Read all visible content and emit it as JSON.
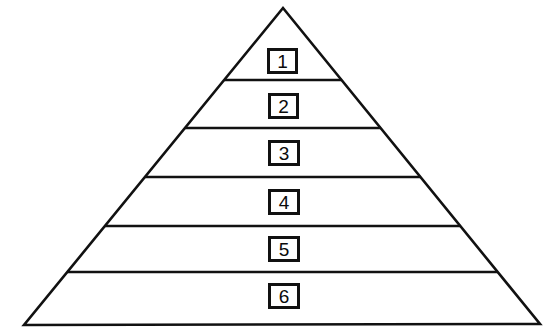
{
  "figure": {
    "type": "pyramid-diagram",
    "title": "",
    "background_color": "#ffffff",
    "stroke_color": "#111111",
    "fill_color": "#ffffff"
  },
  "pyramid": {
    "apex": {
      "x": 283,
      "y": 8
    },
    "base_left": {
      "x": 24,
      "y": 325
    },
    "base_right": {
      "x": 540,
      "y": 324
    },
    "outline_width": 2.6,
    "divider_width": 2.4,
    "divider_y": [
      80,
      128,
      177,
      226,
      272
    ],
    "levels": [
      {
        "label": "1",
        "order": 1,
        "band_top_y": 8,
        "band_bottom_y": 80,
        "box": {
          "x": 267,
          "y": 48,
          "w": 31,
          "h": 26
        }
      },
      {
        "label": "2",
        "order": 2,
        "band_top_y": 80,
        "band_bottom_y": 128,
        "box": {
          "x": 268,
          "y": 93,
          "w": 31,
          "h": 26
        }
      },
      {
        "label": "3",
        "order": 3,
        "band_top_y": 128,
        "band_bottom_y": 177,
        "box": {
          "x": 268,
          "y": 140,
          "w": 32,
          "h": 26
        }
      },
      {
        "label": "4",
        "order": 4,
        "band_top_y": 177,
        "band_bottom_y": 226,
        "box": {
          "x": 268,
          "y": 189,
          "w": 32,
          "h": 26
        }
      },
      {
        "label": "5",
        "order": 5,
        "band_top_y": 226,
        "band_bottom_y": 272,
        "box": {
          "x": 268,
          "y": 236,
          "w": 32,
          "h": 26
        }
      },
      {
        "label": "6",
        "order": 6,
        "band_top_y": 272,
        "band_bottom_y": 325,
        "box": {
          "x": 268,
          "y": 283,
          "w": 32,
          "h": 26
        }
      }
    ]
  },
  "chart_data": {
    "type": "pyramid",
    "title": "",
    "xlabel": "",
    "ylabel": "",
    "categories": [
      "1",
      "2",
      "3",
      "4",
      "5",
      "6"
    ],
    "values": [
      1,
      2,
      3,
      4,
      5,
      6
    ],
    "legend": [],
    "annotations": [],
    "grid": false
  }
}
